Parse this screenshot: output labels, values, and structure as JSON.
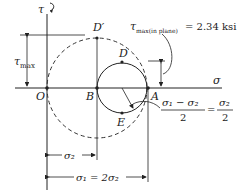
{
  "diagram": {
    "type": "mohr-circle",
    "axes": {
      "horizontal": "σ",
      "vertical": "τ"
    },
    "points": {
      "origin": "O",
      "B": "B",
      "A": "A",
      "D": "D",
      "E": "E",
      "D_prime": "D′"
    },
    "labels": {
      "tau_max": "τ",
      "tau_max_sub": "max",
      "tau_inplane": "τ",
      "tau_inplane_sub": "max(in plane)",
      "tau_inplane_value": "= 2.34 ksi",
      "radius_formula_num": "σ₁ − σ₂",
      "radius_formula_den": "2",
      "radius_formula_eq": "=",
      "radius_formula_rhs_num": "σ₂",
      "radius_formula_rhs_den": "2",
      "sigma2_dim": "σ₂",
      "sigma1_dim": "σ₁ = 2σ₂"
    }
  }
}
